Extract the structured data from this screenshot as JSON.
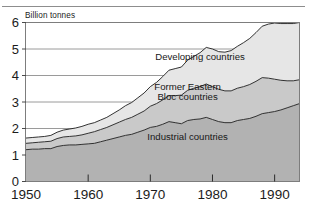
{
  "figure": {
    "axis_title": "Billion tonnes",
    "top_rule": "horizontal-rule"
  },
  "chart_data": {
    "type": "area",
    "title": "",
    "subtitle": "",
    "xlabel": "",
    "ylabel": "Billion tonnes",
    "stacked": true,
    "grid": "horizontal gridlines at each y tick inside plot frame",
    "legend_position": "inline annotations on bands",
    "xlim": [
      1950,
      1994
    ],
    "ylim": [
      0,
      6
    ],
    "xticks": [
      1950,
      1960,
      1970,
      1980,
      1990
    ],
    "xticklabels": [
      "1950",
      "1960",
      "1970",
      "1980",
      "1990"
    ],
    "yticks": [
      0,
      1,
      2,
      3,
      4,
      5,
      6
    ],
    "yticklabels": [
      "0",
      "1",
      "2",
      "3",
      "4",
      "5",
      "6"
    ],
    "x": [
      1950,
      1951,
      1952,
      1953,
      1954,
      1955,
      1956,
      1957,
      1958,
      1959,
      1960,
      1961,
      1962,
      1963,
      1964,
      1965,
      1966,
      1967,
      1968,
      1969,
      1970,
      1971,
      1972,
      1973,
      1974,
      1975,
      1976,
      1977,
      1978,
      1979,
      1980,
      1981,
      1982,
      1983,
      1984,
      1985,
      1986,
      1987,
      1988,
      1989,
      1990,
      1991,
      1992,
      1993,
      1994
    ],
    "series": [
      {
        "name": "Industrial countries",
        "color": "#b2b2b2",
        "values": [
          1.2,
          1.22,
          1.22,
          1.24,
          1.24,
          1.32,
          1.36,
          1.38,
          1.38,
          1.4,
          1.42,
          1.44,
          1.5,
          1.56,
          1.62,
          1.68,
          1.74,
          1.78,
          1.86,
          1.94,
          2.04,
          2.08,
          2.16,
          2.26,
          2.22,
          2.18,
          2.3,
          2.34,
          2.36,
          2.42,
          2.34,
          2.26,
          2.22,
          2.22,
          2.3,
          2.34,
          2.38,
          2.46,
          2.56,
          2.6,
          2.64,
          2.7,
          2.78,
          2.86,
          2.94
        ]
      },
      {
        "name": "Former Eastern Bloc countries",
        "color": "#c9c9c9",
        "values": [
          0.24,
          0.24,
          0.26,
          0.26,
          0.28,
          0.3,
          0.32,
          0.32,
          0.34,
          0.36,
          0.4,
          0.44,
          0.46,
          0.48,
          0.52,
          0.56,
          0.6,
          0.64,
          0.68,
          0.72,
          0.8,
          0.86,
          0.92,
          0.98,
          1.02,
          1.08,
          1.14,
          1.18,
          1.22,
          1.26,
          1.24,
          1.22,
          1.2,
          1.2,
          1.22,
          1.24,
          1.28,
          1.32,
          1.36,
          1.3,
          1.22,
          1.12,
          1.02,
          0.94,
          0.9
        ]
      },
      {
        "name": "Developing countries",
        "color": "#e6e6e6",
        "values": [
          0.2,
          0.2,
          0.2,
          0.2,
          0.22,
          0.24,
          0.26,
          0.28,
          0.3,
          0.32,
          0.34,
          0.34,
          0.36,
          0.38,
          0.42,
          0.46,
          0.52,
          0.56,
          0.62,
          0.68,
          0.74,
          0.8,
          0.88,
          0.96,
          1.02,
          1.06,
          1.14,
          1.2,
          1.28,
          1.38,
          1.42,
          1.42,
          1.46,
          1.52,
          1.58,
          1.66,
          1.74,
          1.84,
          1.94,
          2.04,
          2.12,
          2.14,
          2.16,
          2.16,
          2.16
        ]
      }
    ],
    "totals": [
      1.64,
      1.66,
      1.68,
      1.7,
      1.74,
      1.86,
      1.94,
      1.98,
      2.02,
      2.08,
      2.16,
      2.22,
      2.32,
      2.42,
      2.56,
      2.7,
      2.86,
      2.98,
      3.16,
      3.34,
      3.58,
      3.74,
      3.96,
      4.2,
      4.26,
      4.32,
      4.58,
      4.72,
      4.86,
      5.06,
      5.0,
      4.9,
      4.88,
      4.94,
      5.1,
      5.24,
      5.4,
      5.62,
      5.86,
      5.94,
      5.98,
      5.96,
      5.96,
      5.96,
      6.0
    ],
    "annotations": [
      {
        "text": "Developing countries",
        "x": 1978,
        "y": 4.6
      },
      {
        "text": "Former Eastern",
        "x": 1976,
        "y": 3.45
      },
      {
        "text": "Bloc countries",
        "x": 1976,
        "y": 3.08
      },
      {
        "text": "Industrial countries",
        "x": 1976,
        "y": 1.55
      }
    ]
  }
}
